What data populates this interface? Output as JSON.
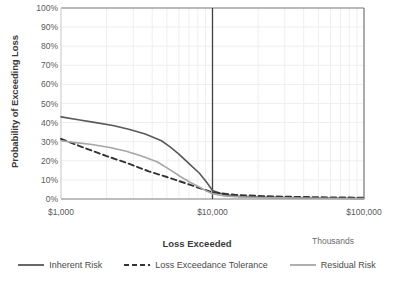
{
  "chart_data": {
    "type": "line",
    "title": "",
    "xlabel": "Loss Exceeded",
    "ylabel": "Probability of Exceeding Loss",
    "x_scale": "log",
    "x_units_note": "Thousands",
    "xlim": [
      1000,
      100000
    ],
    "ylim": [
      0,
      1
    ],
    "grid": true,
    "legend_position": "bottom",
    "x_tick_labels": [
      "$1,000",
      "$10,000",
      "$100,000"
    ],
    "x_tick_values": [
      1000,
      10000,
      100000
    ],
    "y_tick_labels": [
      "100%",
      "90%",
      "80%",
      "70%",
      "60%",
      "50%",
      "40%",
      "30%",
      "20%",
      "10%",
      "0%"
    ],
    "y_tick_values": [
      1.0,
      0.9,
      0.8,
      0.7,
      0.6,
      0.5,
      0.4,
      0.3,
      0.2,
      0.1,
      0.0
    ],
    "annotations": [
      {
        "name": "tolerance-threshold-line",
        "type": "vline",
        "x": 10000,
        "color": "#404040"
      }
    ],
    "series": [
      {
        "name": "Inherent Risk",
        "style": "solid",
        "color": "#595959",
        "width": 1.6,
        "x": [
          1000,
          1300,
          1700,
          2200,
          2800,
          3600,
          4600,
          5200,
          6000,
          7000,
          8200,
          9200,
          10000,
          12000,
          15000,
          20000,
          30000,
          45000,
          70000,
          100000
        ],
        "y": [
          0.43,
          0.415,
          0.4,
          0.385,
          0.365,
          0.34,
          0.305,
          0.275,
          0.235,
          0.185,
          0.135,
          0.085,
          0.045,
          0.022,
          0.014,
          0.01,
          0.007,
          0.005,
          0.004,
          0.003
        ]
      },
      {
        "name": "Loss Exceedance Tolerance",
        "style": "dashed",
        "color": "#333333",
        "width": 1.9,
        "x": [
          1000,
          1400,
          2000,
          2800,
          3800,
          5000,
          6500,
          8000,
          10000,
          14000,
          20000,
          30000,
          45000,
          65000,
          100000
        ],
        "y": [
          0.315,
          0.27,
          0.225,
          0.185,
          0.145,
          0.115,
          0.085,
          0.06,
          0.035,
          0.022,
          0.016,
          0.012,
          0.01,
          0.008,
          0.007
        ]
      },
      {
        "name": "Residual Risk",
        "style": "solid",
        "color": "#a6a6a6",
        "width": 1.6,
        "x": [
          1000,
          1250,
          1600,
          2100,
          2700,
          3400,
          4300,
          5200,
          6200,
          7200,
          8300,
          9200,
          10000,
          12000,
          15000,
          20000,
          30000,
          50000,
          75000,
          100000
        ],
        "y": [
          0.305,
          0.295,
          0.285,
          0.27,
          0.25,
          0.225,
          0.195,
          0.155,
          0.115,
          0.085,
          0.06,
          0.04,
          0.028,
          0.016,
          0.011,
          0.008,
          0.006,
          0.004,
          0.003,
          0.003
        ]
      }
    ]
  },
  "colors": {
    "inherent": "#595959",
    "tolerance": "#333333",
    "residual": "#a6a6a6",
    "grid_minor": "#eeeeee",
    "grid_major": "#d9d9d9",
    "axis": "#7f7f7f",
    "threshold": "#404040",
    "text": "#5a5a5a",
    "title_text": "#3a3a3a"
  },
  "legend": {
    "items": [
      {
        "label": "Inherent Risk",
        "style": "solid",
        "color": "#595959"
      },
      {
        "label": "Loss Exceedance Tolerance",
        "style": "dashed",
        "color": "#333333"
      },
      {
        "label": "Residual Risk",
        "style": "solid",
        "color": "#a6a6a6"
      }
    ]
  }
}
